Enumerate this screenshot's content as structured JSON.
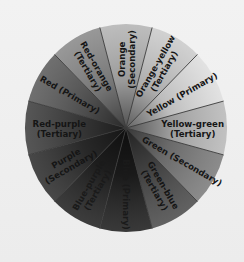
{
  "wheel": {
    "center": [
      126,
      128
    ],
    "radius": [
      101,
      104
    ],
    "divider_color": "#3a3a3a",
    "segments": [
      {
        "line1": "Orange",
        "line2": "(Secondary)",
        "start": -105,
        "end": -75,
        "fill": "#b4b4b4",
        "dim": false
      },
      {
        "line1": "Orange-yellow",
        "line2": "(Tertiary)",
        "start": -75,
        "end": -45,
        "fill": "#cbcbcb",
        "dim": false
      },
      {
        "line1": "Yellow (Primary)",
        "line2": "",
        "start": -45,
        "end": -15,
        "fill": "#dedede",
        "dim": false
      },
      {
        "line1": "Yellow-green",
        "line2": "(Tertiary)",
        "start": -15,
        "end": 15,
        "fill": "#b9b9b9",
        "dim": false
      },
      {
        "line1": "Green (Secondary)",
        "line2": "",
        "start": 15,
        "end": 45,
        "fill": "#7c7c7c",
        "dim": false
      },
      {
        "line1": "Green-blue",
        "line2": "(Tertiary)",
        "start": 45,
        "end": 75,
        "fill": "#4c4c4c",
        "dim": false
      },
      {
        "line1": "Blue (Primary)",
        "line2": "",
        "start": 75,
        "end": 105,
        "fill": "#1e1e1e",
        "dim": true
      },
      {
        "line1": "Blue-purple",
        "line2": "(Tertiary)",
        "start": 105,
        "end": 135,
        "fill": "#222222",
        "dim": true
      },
      {
        "line1": "Purple",
        "line2": "(Secondary)",
        "start": 135,
        "end": 165,
        "fill": "#2f2f2f",
        "dim": false
      },
      {
        "line1": "Red-purple",
        "line2": "(Tertiary)",
        "start": 165,
        "end": 195,
        "fill": "#3f3f3f",
        "dim": false
      },
      {
        "line1": "Red (Primary)",
        "line2": "",
        "start": 195,
        "end": 225,
        "fill": "#5c5c5c",
        "dim": false
      },
      {
        "line1": "Red-orange",
        "line2": "(Tertiary)",
        "start": 225,
        "end": 255,
        "fill": "#8a8a8a",
        "dim": false
      }
    ]
  }
}
